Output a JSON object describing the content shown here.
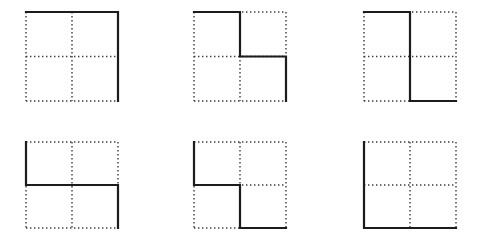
{
  "figure_board": {
    "title": "Lattice path figures",
    "background_color": "#ffffff",
    "grid_columns": 3,
    "grid_rows": 2,
    "cell_size_px": 92,
    "subdivisions": 2,
    "dotted_color": "#3a3a3a",
    "solid_color": "#1c1c1c",
    "figures": [
      {
        "id": "figure-1",
        "label": "Figure 1",
        "position": {
          "x": 26,
          "y": 12
        },
        "size": {
          "width": 92,
          "height": 89
        },
        "path_description": "Along the top edge, then down the right edge",
        "path_points": [
          [
            0,
            0
          ],
          [
            2,
            0
          ],
          [
            2,
            2
          ]
        ],
        "path_svg": "M 0 0 L 92 0 L 92 89"
      },
      {
        "id": "figure-2",
        "label": "Figure 2",
        "position": {
          "x": 194,
          "y": 12
        },
        "size": {
          "width": 92,
          "height": 89
        },
        "path_description": "Top edge of left half, down middle vertical to center, right along middle horizontal, then down the right edge",
        "path_points": [
          [
            0,
            0
          ],
          [
            1,
            0
          ],
          [
            1,
            1
          ],
          [
            2,
            1
          ],
          [
            2,
            2
          ]
        ],
        "path_svg": "M 0 0 L 46 0 L 46 44.5 L 92 44.5 L 92 89"
      },
      {
        "id": "figure-3",
        "label": "Figure 3",
        "position": {
          "x": 364,
          "y": 12
        },
        "size": {
          "width": 92,
          "height": 89
        },
        "path_description": "Top edge of left half, down the full middle vertical, then right along the bottom edge",
        "path_points": [
          [
            0,
            0
          ],
          [
            1,
            0
          ],
          [
            1,
            2
          ],
          [
            2,
            2
          ]
        ],
        "path_svg": "M 0 0 L 46 0 L 46 89 L 92 89"
      },
      {
        "id": "figure-4",
        "label": "Figure 4",
        "position": {
          "x": 26,
          "y": 142
        },
        "size": {
          "width": 92,
          "height": 86
        },
        "path_description": "Down the left edge to center height, right along the full middle horizontal, then down the right edge",
        "path_points": [
          [
            0,
            0
          ],
          [
            0,
            1
          ],
          [
            2,
            1
          ],
          [
            2,
            2
          ]
        ],
        "path_svg": "M 0 0 L 0 43 L 92 43 L 92 86"
      },
      {
        "id": "figure-5",
        "label": "Figure 5",
        "position": {
          "x": 194,
          "y": 142
        },
        "size": {
          "width": 92,
          "height": 86
        },
        "path_description": "Down the left edge to center height, right along middle horizontal to center, down middle vertical, then right along the bottom edge",
        "path_points": [
          [
            0,
            0
          ],
          [
            0,
            1
          ],
          [
            1,
            1
          ],
          [
            1,
            2
          ],
          [
            2,
            2
          ]
        ],
        "path_svg": "M 0 0 L 0 43 L 46 43 L 46 86 L 92 86"
      },
      {
        "id": "figure-6",
        "label": "Figure 6",
        "position": {
          "x": 364,
          "y": 142
        },
        "size": {
          "width": 92,
          "height": 86
        },
        "path_description": "Down the full left edge, then right along the full bottom edge",
        "path_points": [
          [
            0,
            0
          ],
          [
            0,
            2
          ],
          [
            2,
            2
          ]
        ],
        "path_svg": "M 0 0 L 0 86 L 92 86"
      }
    ]
  }
}
